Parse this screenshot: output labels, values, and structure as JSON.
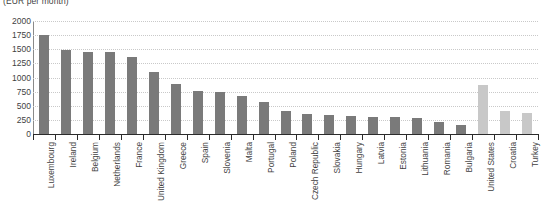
{
  "chart_data": {
    "type": "bar",
    "title": "(EUR per month)",
    "xlabel": "",
    "ylabel": "",
    "ylim": [
      0,
      2000
    ],
    "yticks": [
      0,
      250,
      500,
      750,
      1000,
      1250,
      1500,
      1750,
      2000
    ],
    "grid": true,
    "legend": "none",
    "categories": [
      "Luxembourg",
      "Ireland",
      "Belgium",
      "Netherlands",
      "France",
      "United Kingdom",
      "Greece",
      "Spain",
      "Slovenia",
      "Malta",
      "Portugal",
      "Poland",
      "Czech Republic",
      "Slovakia",
      "Hungary",
      "Latvia",
      "Estonia",
      "Lithuania",
      "Romania",
      "Bulgaria",
      "United States",
      "Croatia",
      "Turkey"
    ],
    "values": [
      1760,
      1480,
      1460,
      1450,
      1370,
      1090,
      880,
      760,
      750,
      680,
      570,
      400,
      350,
      340,
      320,
      310,
      300,
      280,
      210,
      160,
      860,
      400,
      370
    ],
    "colors": {
      "primary": "#7a7a7a",
      "secondary": "#c8c8c8",
      "grid": "#c9c9c9",
      "axis": "#2b2b2b",
      "text": "#3f3f3f"
    },
    "series_groups": [
      {
        "name": "EU / Europe",
        "color": "#7a7a7a",
        "from": 0,
        "to": 19
      },
      {
        "name": "Non-EU comparators",
        "color": "#c8c8c8",
        "from": 20,
        "to": 22
      }
    ]
  }
}
